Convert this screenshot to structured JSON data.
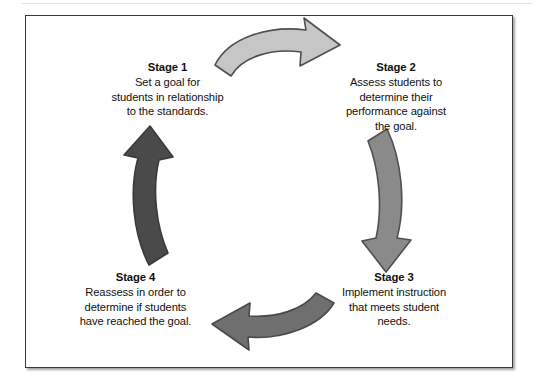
{
  "figure": {
    "type": "cyclical-process-diagram",
    "stages": [
      {
        "id": "stage-1",
        "title": "Stage 1",
        "body": "Set a goal for\nstudents in relationship\nto the standards."
      },
      {
        "id": "stage-2",
        "title": "Stage 2",
        "body": "Assess students to\ndetermine their\nperformance against\nthe goal."
      },
      {
        "id": "stage-3",
        "title": "Stage 3",
        "body": "Implement instruction\nthat meets student\nneeds."
      },
      {
        "id": "stage-4",
        "title": "Stage 4",
        "body": "Reassess in order to\ndetermine if students\nhave reached the goal."
      }
    ],
    "arrows": [
      {
        "id": "arrow-top",
        "from": "stage-1",
        "to": "stage-2",
        "direction": "right",
        "fill": "#c6c6c6",
        "stroke": "#4f4f4f"
      },
      {
        "id": "arrow-right",
        "from": "stage-2",
        "to": "stage-3",
        "direction": "down",
        "fill": "#8a8a8a",
        "stroke": "#4f4f4f"
      },
      {
        "id": "arrow-bottom",
        "from": "stage-3",
        "to": "stage-4",
        "direction": "left",
        "fill": "#6f6f6f",
        "stroke": "#4a4a4a"
      },
      {
        "id": "arrow-left",
        "from": "stage-4",
        "to": "stage-1",
        "direction": "up",
        "fill": "#4a4a4a",
        "stroke": "#3a3a3a"
      }
    ],
    "frame": {
      "border_color": "#3a3a3a",
      "background": "#ffffff"
    }
  }
}
